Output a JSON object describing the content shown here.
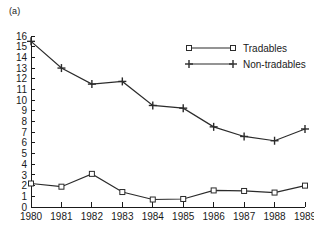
{
  "panel": {
    "label": "(a)"
  },
  "chart_data": {
    "type": "line",
    "title": "",
    "subtitle": "",
    "xlabel": "",
    "ylabel": "",
    "categories": [
      "1980",
      "1981",
      "1982",
      "1983",
      "1984",
      "1985",
      "1986",
      "1987",
      "1988",
      "1989"
    ],
    "x": [
      1980,
      1981,
      1982,
      1983,
      1984,
      1985,
      1986,
      1987,
      1988,
      1989
    ],
    "series": [
      {
        "name": "Tradables",
        "marker": "square",
        "values": [
          2.2,
          1.9,
          3.1,
          1.4,
          0.7,
          0.75,
          1.55,
          1.5,
          1.35,
          2.0
        ]
      },
      {
        "name": "Non-tradables",
        "marker": "plus",
        "values": [
          15.5,
          13.0,
          11.5,
          11.75,
          9.5,
          9.25,
          7.5,
          6.6,
          6.2,
          7.3
        ]
      }
    ],
    "ylim": [
      0,
      16
    ],
    "xlim": [
      1980,
      1989
    ],
    "yticks": [
      0,
      1,
      2,
      3,
      4,
      5,
      6,
      7,
      8,
      9,
      10,
      11,
      12,
      13,
      14,
      15,
      16
    ],
    "ytick_labels": [
      "0",
      "1",
      "2",
      "3",
      "4",
      "5",
      "6",
      "7",
      "8",
      "9",
      "10",
      "11",
      "12",
      "13",
      "14",
      "15",
      "16"
    ],
    "xticks": [
      1980,
      1981,
      1982,
      1983,
      1984,
      1985,
      1986,
      1987,
      1988,
      1989
    ],
    "grid": false,
    "legend_position": "top-right",
    "legend_entries": [
      "Tradables",
      "Non-tradables"
    ],
    "line_color": "#2b2b2b",
    "background": "#ffffff"
  }
}
